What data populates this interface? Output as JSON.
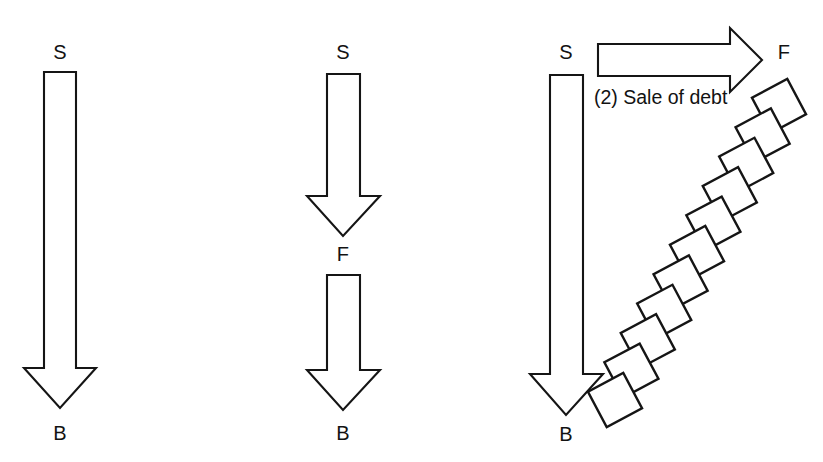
{
  "diagram": {
    "background_color": "#ffffff",
    "stroke_color": "#151515",
    "fill_color": "#ffffff",
    "width": 823,
    "height": 462
  },
  "panels": [
    {
      "id": "panel-1",
      "name": "direct-debt-flow",
      "labels": {
        "top": "S",
        "bottom": "B"
      },
      "arrows": [
        {
          "name": "arrow-s-to-b",
          "direction": "down",
          "from": "S",
          "to": "B",
          "shaft_left": 44,
          "shaft_right": 76,
          "shaft_top": 72,
          "head_top": 368,
          "head_left": 24,
          "head_right": 96,
          "tip_y": 408
        }
      ],
      "label_positions": {
        "top": {
          "x": 60,
          "y": 52
        },
        "bottom": {
          "x": 60,
          "y": 433
        }
      }
    },
    {
      "id": "panel-2",
      "name": "intermediated-debt-flow",
      "labels": {
        "top": "S",
        "middle": "F",
        "bottom": "B"
      },
      "arrows": [
        {
          "name": "arrow-s-to-f",
          "direction": "down",
          "from": "S",
          "to": "F",
          "shaft_left": 327,
          "shaft_right": 360,
          "shaft_top": 74,
          "head_top": 196,
          "head_left": 307,
          "head_right": 380,
          "tip_y": 236
        },
        {
          "name": "arrow-f-to-b",
          "direction": "down",
          "from": "F",
          "to": "B",
          "shaft_left": 327,
          "shaft_right": 360,
          "shaft_top": 275,
          "head_top": 370,
          "head_left": 307,
          "head_right": 380,
          "tip_y": 410
        }
      ],
      "label_positions": {
        "top": {
          "x": 343,
          "y": 52
        },
        "middle": {
          "x": 343,
          "y": 254
        },
        "bottom": {
          "x": 343,
          "y": 433
        }
      }
    },
    {
      "id": "panel-3",
      "name": "sale-of-debt-flow",
      "labels": {
        "top": "S",
        "bottom": "B",
        "right": "F"
      },
      "caption": "(2) Sale of debt",
      "arrows": [
        {
          "name": "arrow-s-to-b",
          "direction": "down",
          "from": "S",
          "to": "B",
          "shaft_left": 550,
          "shaft_right": 583,
          "shaft_top": 75,
          "head_top": 374,
          "head_left": 530,
          "head_right": 603,
          "tip_y": 415
        },
        {
          "name": "arrow-sale-of-debt",
          "direction": "right",
          "to": "F",
          "shaft_top": 44,
          "shaft_bottom": 76,
          "shaft_left": 598,
          "head_left": 730,
          "head_top": 28,
          "head_bottom": 92,
          "tip_x": 762,
          "tip_y": 60
        }
      ],
      "chain": {
        "name": "debt-block-chain",
        "square_count": 11,
        "square_size": 40,
        "rotation_deg": -28,
        "start_center": {
          "x": 779,
          "y": 106
        },
        "end_center": {
          "x": 615,
          "y": 400
        }
      },
      "label_positions": {
        "top": {
          "x": 566,
          "y": 52
        },
        "bottom": {
          "x": 566,
          "y": 434
        },
        "right": {
          "x": 784,
          "y": 52
        },
        "caption": {
          "x": 594,
          "y": 98
        }
      }
    }
  ]
}
